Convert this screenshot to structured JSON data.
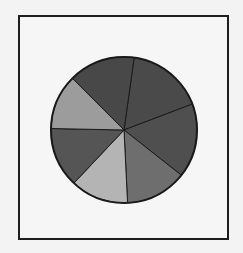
{
  "chart_data": {
    "type": "pie",
    "title": "",
    "labels": [
      "Slice 1",
      "Slice 2",
      "Slice 3",
      "Slice 4",
      "Slice 5",
      "Slice 6",
      "Slice 7"
    ],
    "values": [
      17.0,
      16.4,
      13.6,
      12.8,
      13.3,
      12.2,
      14.7
    ],
    "start_angle_deg": 8,
    "direction": "clockwise",
    "colors": [
      "#4a4a4a",
      "#4f4f4f",
      "#6e6e6e",
      "#b4b4b4",
      "#555555",
      "#9c9c9c",
      "#484848"
    ],
    "legend": "none",
    "center": [
      124,
      130
    ],
    "radius": 73
  }
}
